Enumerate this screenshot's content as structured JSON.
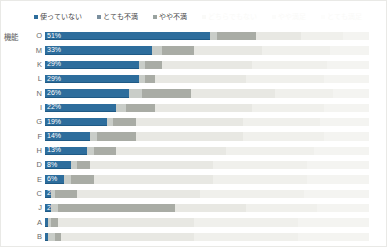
{
  "title": "",
  "axis_group_label": "機能",
  "legend": {
    "position": "top",
    "items": [
      {
        "label": "使っていない",
        "color": "#2d6d9c",
        "faded": false
      },
      {
        "label": "とても不満",
        "color": "#7a8f9e",
        "faded": false
      },
      {
        "label": "やや不満",
        "color": "#9aa3a0",
        "faded": false
      },
      {
        "label": "どちらでもない",
        "color": "#e6e6e1",
        "faded": true
      },
      {
        "label": "やや満足",
        "color": "#f0f0ec",
        "faded": true
      },
      {
        "label": "とても満足",
        "color": "#f5f5f2",
        "faded": true
      }
    ]
  },
  "colors": {
    "series_1": "#2d6d9c",
    "series_2": "#c9cdc8",
    "series_3": "#a9aca5",
    "series_4": "#e8e8e3",
    "series_5": "#f0f0ec",
    "series_6": "#f4f4f1",
    "plot_border": "#e9e9e6",
    "label_text": "#6a6a6a",
    "value_text": "#ffffff",
    "background": "#ffffff"
  },
  "chart_data": {
    "type": "bar",
    "orientation": "horizontal",
    "stacked": true,
    "normalized_percent": true,
    "title": "",
    "xlabel": "",
    "ylabel": "機能",
    "xlim": [
      0,
      100
    ],
    "grid": false,
    "legend_position": "top",
    "categories": [
      "O",
      "M",
      "K",
      "L",
      "N",
      "I",
      "G",
      "F",
      "H",
      "D",
      "E",
      "C",
      "J",
      "A",
      "B"
    ],
    "series": [
      {
        "name": "使っていない",
        "values": [
          51,
          33,
          29,
          29,
          26,
          22,
          19,
          14,
          13,
          8,
          6,
          2,
          2,
          1,
          1
        ]
      },
      {
        "name": "とても不満",
        "values": [
          2,
          3,
          2,
          2,
          4,
          3,
          2,
          2,
          2,
          2,
          2,
          1,
          2,
          1,
          2
        ]
      },
      {
        "name": "やや不満",
        "values": [
          12,
          10,
          5,
          3,
          15,
          9,
          7,
          12,
          7,
          4,
          7,
          7,
          36,
          2,
          2
        ]
      },
      {
        "name": "どちらでもない",
        "values": [
          14,
          21,
          28,
          28,
          26,
          30,
          33,
          33,
          34,
          38,
          37,
          38,
          22,
          42,
          41
        ]
      },
      {
        "name": "やや満足",
        "values": [
          13,
          21,
          23,
          24,
          18,
          22,
          24,
          25,
          27,
          29,
          29,
          32,
          22,
          32,
          32
        ]
      },
      {
        "name": "とても満足",
        "values": [
          8,
          12,
          13,
          14,
          11,
          14,
          15,
          14,
          17,
          19,
          19,
          20,
          16,
          22,
          22
        ]
      }
    ],
    "value_labels": [
      "51%",
      "33%",
      "29%",
      "29%",
      "26%",
      "22%",
      "19%",
      "14%",
      "13%",
      "8%",
      "6%",
      "2%",
      "2%",
      "",
      ""
    ]
  }
}
